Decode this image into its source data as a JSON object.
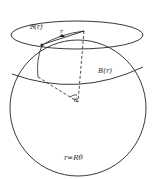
{
  "figure": {
    "labels": {
      "tangent_ball": "𝔅(r)",
      "geodesic_ball": "B(r)",
      "radius": "r",
      "angle": "θ",
      "relation": "r=Rθ"
    },
    "colors": {
      "stroke": "#222222",
      "background": "#ffffff"
    }
  }
}
